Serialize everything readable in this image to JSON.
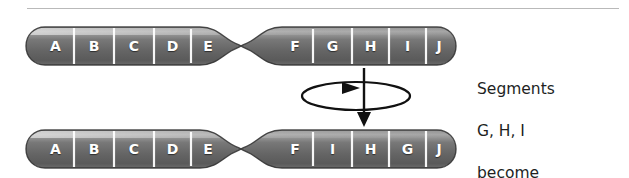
{
  "figure": {
    "top_rule": true
  },
  "colors": {
    "chromosome_body_dark": "#5d5d5d",
    "chromosome_body_mid": "#7a7a7a",
    "chromosome_body_light": "#9e9e9e",
    "chromosome_edge": "#3a3a3a",
    "band_divider": "#ffffff",
    "label_text": "#ffffff",
    "caption_text": "#221f1f",
    "arrow_stroke": "#111111",
    "top_rule": "#b9b9b9"
  },
  "chromosomes": [
    {
      "id": "chromosome-top",
      "name": "original-chromosome",
      "arm_left_segments": [
        "A",
        "B",
        "C",
        "D",
        "E"
      ],
      "arm_right_segments": [
        "F",
        "G",
        "H",
        "I",
        "J"
      ],
      "centromere": true
    },
    {
      "id": "chromosome-bottom",
      "name": "inverted-chromosome",
      "arm_left_segments": [
        "A",
        "B",
        "C",
        "D",
        "E"
      ],
      "arm_right_segments": [
        "F",
        "I",
        "H",
        "G",
        "J"
      ],
      "centromere": true
    }
  ],
  "rotation_symbol": {
    "name": "rotation-arrow",
    "description": "downward arrow through horizontal ellipse indicating 180 degree rotation"
  },
  "caption": {
    "lines": [
      "Segments",
      "G, H, I",
      "become",
      "inverted"
    ],
    "line1": "Segments",
    "line2": "G, H, I",
    "line3": "become",
    "line4": "inverted"
  }
}
